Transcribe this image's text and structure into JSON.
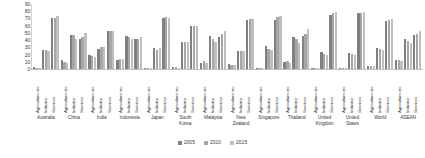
{
  "chart_data": {
    "type": "bar",
    "title": "",
    "subtitle": "",
    "xlabel": "",
    "ylabel": "",
    "ylim": [
      0,
      90
    ],
    "grid": false,
    "legend_position": "bottom",
    "y_ticks": [
      90,
      80,
      70,
      60,
      50,
      40,
      30,
      20,
      10,
      0
    ],
    "sectors": [
      "Agriculture etc",
      "Industry",
      "Services"
    ],
    "categories": [
      "Australia",
      "China",
      "India",
      "Indonesia",
      "Japan",
      "South Korea",
      "Malaysia",
      "New Zealand",
      "Singapore",
      "Thailand",
      "United Kingdom",
      "United States",
      "World",
      "ASEAN"
    ],
    "series": [
      {
        "name": "2005",
        "color": "#808080"
      },
      {
        "name": "2010",
        "color": "#a6a6a6"
      },
      {
        "name": "2015",
        "color": "#bfbfbf"
      }
    ],
    "groups": [
      {
        "category": "Australia",
        "sectors": [
          {
            "sector": "Agriculture etc",
            "values": [
              3,
              2,
              2
            ]
          },
          {
            "sector": "Industry",
            "values": [
              26,
              27,
              25
            ]
          },
          {
            "sector": "Services",
            "values": [
              71,
              71,
              73
            ]
          }
        ]
      },
      {
        "category": "China",
        "sectors": [
          {
            "sector": "Agriculture etc",
            "values": [
              12,
              10,
              9
            ]
          },
          {
            "sector": "Industry",
            "values": [
              47,
              47,
              41
            ]
          },
          {
            "sector": "Services",
            "values": [
              41,
              44,
              50
            ]
          }
        ]
      },
      {
        "category": "India",
        "sectors": [
          {
            "sector": "Agriculture etc",
            "values": [
              19,
              18,
              17
            ]
          },
          {
            "sector": "Industry",
            "values": [
              28,
              30,
              30
            ]
          },
          {
            "sector": "Services",
            "values": [
              53,
              52,
              53
            ]
          }
        ]
      },
      {
        "category": "Indonesia",
        "sectors": [
          {
            "sector": "Agriculture etc",
            "values": [
              13,
              14,
              14
            ]
          },
          {
            "sector": "Industry",
            "values": [
              46,
              45,
              41
            ]
          },
          {
            "sector": "Services",
            "values": [
              41,
              41,
              45
            ]
          }
        ]
      },
      {
        "category": "Japan",
        "sectors": [
          {
            "sector": "Agriculture etc",
            "values": [
              1,
              1,
              1
            ]
          },
          {
            "sector": "Industry",
            "values": [
              29,
              27,
              29
            ]
          },
          {
            "sector": "Services",
            "values": [
              70,
              72,
              70
            ]
          }
        ]
      },
      {
        "category": "South Korea",
        "sectors": [
          {
            "sector": "Agriculture etc",
            "values": [
              3,
              3,
              2
            ]
          },
          {
            "sector": "Industry",
            "values": [
              37,
              38,
              38
            ]
          },
          {
            "sector": "Services",
            "values": [
              60,
              59,
              60
            ]
          }
        ]
      },
      {
        "category": "Malaysia",
        "sectors": [
          {
            "sector": "Agriculture etc",
            "values": [
              9,
              11,
              9
            ]
          },
          {
            "sector": "Industry",
            "values": [
              46,
              41,
              38
            ]
          },
          {
            "sector": "Services",
            "values": [
              45,
              48,
              53
            ]
          }
        ]
      },
      {
        "category": "New Zealand",
        "sectors": [
          {
            "sector": "Agriculture etc",
            "values": [
              7,
              6,
              6
            ]
          },
          {
            "sector": "Industry",
            "values": [
              25,
              25,
              25
            ]
          },
          {
            "sector": "Services",
            "values": [
              68,
              69,
              69
            ]
          }
        ]
      },
      {
        "category": "Singapore",
        "sectors": [
          {
            "sector": "Agriculture etc",
            "values": [
              0,
              0,
              0
            ]
          },
          {
            "sector": "Industry",
            "values": [
              32,
              28,
              26
            ]
          },
          {
            "sector": "Services",
            "values": [
              68,
              72,
              74
            ]
          }
        ]
      },
      {
        "category": "Thailand",
        "sectors": [
          {
            "sector": "Agriculture etc",
            "values": [
              10,
              11,
              9
            ]
          },
          {
            "sector": "Industry",
            "values": [
              44,
              41,
              36
            ]
          },
          {
            "sector": "Services",
            "values": [
              46,
              48,
              55
            ]
          }
        ]
      },
      {
        "category": "United Kingdom",
        "sectors": [
          {
            "sector": "Agriculture etc",
            "values": [
              1,
              1,
              1
            ]
          },
          {
            "sector": "Industry",
            "values": [
              24,
              21,
              20
            ]
          },
          {
            "sector": "Services",
            "values": [
              75,
              78,
              79
            ]
          }
        ]
      },
      {
        "category": "United States",
        "sectors": [
          {
            "sector": "Agriculture etc",
            "values": [
              1,
              1,
              1
            ]
          },
          {
            "sector": "Industry",
            "values": [
              22,
              21,
              20
            ]
          },
          {
            "sector": "Services",
            "values": [
              77,
              78,
              79
            ]
          }
        ]
      },
      {
        "category": "World",
        "sectors": [
          {
            "sector": "Agriculture etc",
            "values": [
              4,
              4,
              4
            ]
          },
          {
            "sector": "Industry",
            "values": [
              29,
              28,
              27
            ]
          },
          {
            "sector": "Services",
            "values": [
              67,
              68,
              69
            ]
          }
        ]
      },
      {
        "category": "ASEAN",
        "sectors": [
          {
            "sector": "Agriculture etc",
            "values": [
              12,
              12,
              11
            ]
          },
          {
            "sector": "Industry",
            "values": [
              41,
              39,
              36
            ]
          },
          {
            "sector": "Services",
            "values": [
              47,
              49,
              53
            ]
          }
        ]
      }
    ]
  }
}
